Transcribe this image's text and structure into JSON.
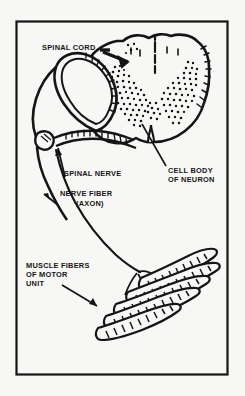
{
  "figure": {
    "background_color": "#f7f7f5",
    "ink_color": "#151515",
    "frame": {
      "x": 16,
      "y": 21,
      "width": 212,
      "height": 354,
      "stroke_color": "#151515"
    }
  },
  "labels": {
    "spinal_cord": "SPINAL CORD",
    "spinal_nerve": "SPINAL NERVE",
    "cell_body_line1": "CELL BODY",
    "cell_body_line2": "OF NEURON",
    "nerve_fiber_line1": "NERVE FIBER",
    "nerve_fiber_line2": "(AXON)",
    "muscle_fibers_line1": "MUSCLE FIBERS",
    "muscle_fibers_line2": "OF MOTOR",
    "muscle_fibers_line3": "UNIT"
  }
}
